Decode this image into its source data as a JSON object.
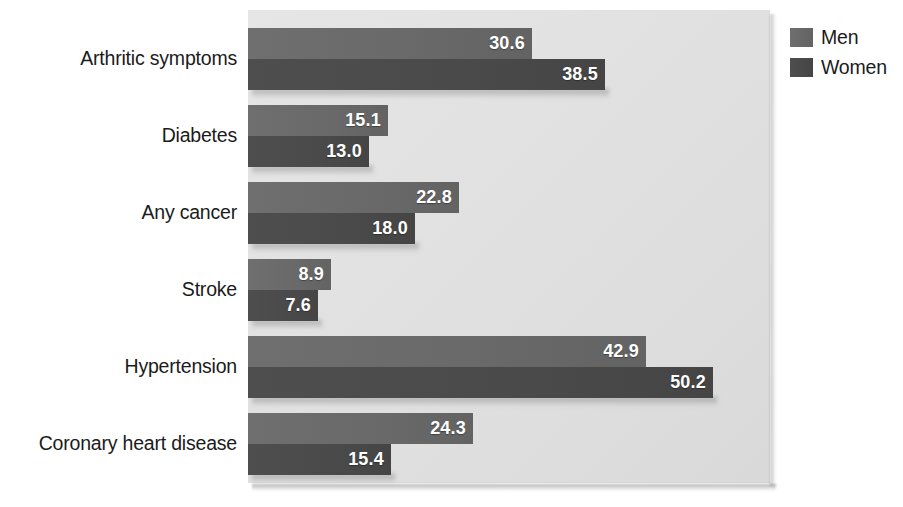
{
  "chart_data": {
    "type": "bar",
    "orientation": "horizontal",
    "title": "",
    "subtitle": "",
    "xlabel": "",
    "ylabel": "",
    "grid": false,
    "legend_position": "top-right",
    "xlim": [
      0,
      56
    ],
    "categories": [
      "Arthritic symptoms",
      "Diabetes",
      "Any cancer",
      "Stroke",
      "Hypertension",
      "Coronary heart disease"
    ],
    "series": [
      {
        "name": "Men",
        "color": "#696969",
        "values": [
          30.6,
          15.1,
          22.8,
          8.9,
          42.9,
          24.3
        ]
      },
      {
        "name": "Women",
        "color": "#4a4a4a",
        "values": [
          38.5,
          13.0,
          18.0,
          7.6,
          50.2,
          15.4
        ]
      }
    ],
    "value_labels": [
      [
        "30.6",
        "38.5"
      ],
      [
        "15.1",
        "13.0"
      ],
      [
        "22.8",
        "18.0"
      ],
      [
        "8.9",
        "7.6"
      ],
      [
        "42.9",
        "50.2"
      ],
      [
        "24.3",
        "15.4"
      ]
    ]
  },
  "legend": {
    "items": [
      {
        "label": "Men"
      },
      {
        "label": "Women"
      }
    ]
  },
  "colors": {
    "men": "#696969",
    "women": "#4a4a4a",
    "plot_background": "#e2e2e2",
    "label_text": "#1b1b1b",
    "value_text": "#ffffff"
  }
}
